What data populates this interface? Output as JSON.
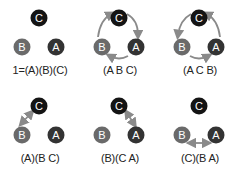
{
  "colors": {
    "C": "#141414",
    "A": "#333333",
    "B": "#6a6a6a",
    "arrow": "#8a8a8a",
    "text": "#ffffff"
  },
  "nodes": {
    "C": "C",
    "B": "B",
    "A": "A"
  },
  "cells": [
    {
      "label": "1=(A)(B)(C)",
      "arrows": "none"
    },
    {
      "label": "(A B C)",
      "arrows": "cycle-cw"
    },
    {
      "label": "(A C B)",
      "arrows": "cycle-ccw"
    },
    {
      "label": "(A)(B C)",
      "arrows": "swap-BC"
    },
    {
      "label": "(B)(C A)",
      "arrows": "swap-CA"
    },
    {
      "label": "(C)(B A)",
      "arrows": "swap-BA"
    }
  ]
}
